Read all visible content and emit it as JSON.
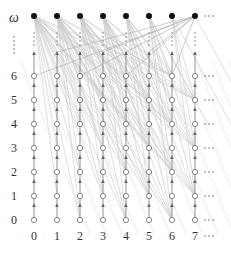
{
  "diagram": {
    "title": "",
    "top_label": "ω",
    "row_labels": [
      "0",
      "1",
      "2",
      "3",
      "4",
      "5",
      "6"
    ],
    "column_labels": [
      "0",
      "1",
      "2",
      "3",
      "4",
      "5",
      "6",
      "7"
    ],
    "ellipsis_right": "- - -",
    "colors": {
      "node_filled": "#111111",
      "node_open_stroke": "#666666",
      "edge": "#777777",
      "fan_edge": "#c8c8c8",
      "text": "#333333"
    },
    "layout": {
      "column_x": [
        34,
        57,
        80,
        103,
        126,
        149,
        172,
        195
      ],
      "row_y": [
        220,
        196,
        172,
        148,
        124,
        100,
        76
      ],
      "omega_y": 16,
      "label_x": 14,
      "column_label_y": 240
    }
  }
}
